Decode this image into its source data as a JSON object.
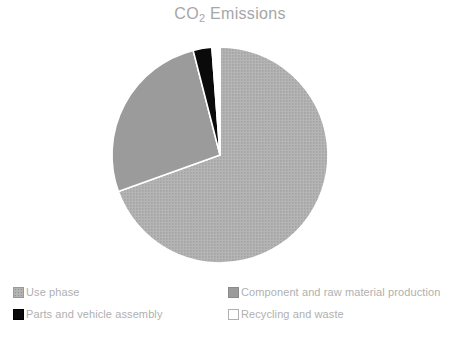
{
  "chart_data": {
    "type": "pie",
    "title": "CO2 Emissions",
    "title_prefix": "CO",
    "title_subscript": "2",
    "title_suffix": " Emissions",
    "xlabel": "",
    "ylabel": "",
    "grid": false,
    "legend_position": "bottom",
    "start_angle_deg": 0,
    "direction": "clockwise",
    "categories": [
      "Use phase",
      "Component and raw material production",
      "Parts and vehicle assembly",
      "Recycling and waste"
    ],
    "values": [
      69.5,
      26.5,
      2.8,
      1.2
    ],
    "units": "percent",
    "slices": [
      {
        "label": "Use phase",
        "value": 69.5,
        "angle_deg": 250.2,
        "fill_style": "dotted-gray",
        "color": "#b3b3b3"
      },
      {
        "label": "Component and raw material production",
        "value": 26.5,
        "angle_deg": 95.4,
        "fill_style": "solid-gray",
        "color": "#9b9b9b"
      },
      {
        "label": "Parts and vehicle assembly",
        "value": 2.8,
        "angle_deg": 10.1,
        "fill_style": "solid-black",
        "color": "#0a0a0a"
      },
      {
        "label": "Recycling and waste",
        "value": 1.2,
        "angle_deg": 4.3,
        "fill_style": "white-outline",
        "color": "#ffffff"
      }
    ]
  },
  "chart": {
    "title_prefix": "CO",
    "title_subscript": "2",
    "title_suffix": " Emissions"
  },
  "legend": {
    "entries": [
      {
        "label": "Use phase",
        "swatch": "dotted-gray-swatch"
      },
      {
        "label": "Component and raw material production",
        "swatch": "solid-gray-swatch"
      },
      {
        "label": "Parts and vehicle assembly",
        "swatch": "black-swatch"
      },
      {
        "label": "Recycling and waste",
        "swatch": "white-swatch"
      }
    ]
  },
  "colors": {
    "background": "#ffffff",
    "title_text": "#a6a6a6",
    "legend_text": "#b0b0b0",
    "use_phase": "#b3b3b3",
    "component_production": "#9b9b9b",
    "parts_assembly": "#0a0a0a",
    "recycling_waste": "#ffffff",
    "slice_border": "#ffffff"
  }
}
